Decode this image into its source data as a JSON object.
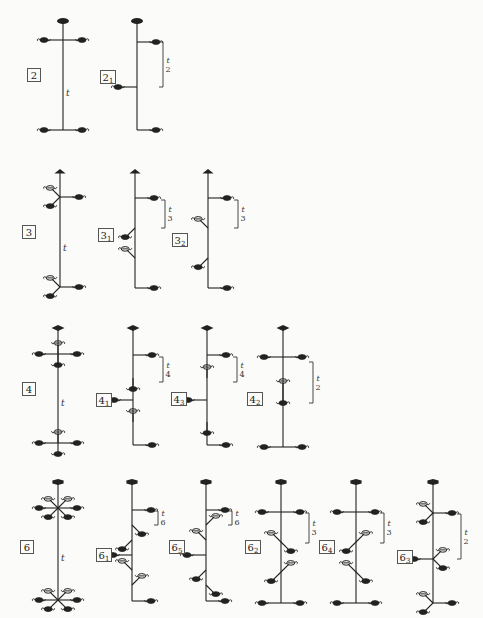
{
  "diagram": {
    "axis_label": "t",
    "rows": [
      {
        "order": 2,
        "elements": [
          {
            "id": "2",
            "label": "2",
            "sub": "",
            "x": 63,
            "top": 21,
            "bottom": 130,
            "box": [
              27,
              68
            ],
            "arms": [
              {
                "y": 40,
                "dirs": [
                  "L",
                  "R"
                ]
              },
              {
                "y": 130,
                "dirs": [
                  "L",
                  "R"
                ]
              }
            ],
            "bracket": null,
            "t_label": [
              66,
              88
            ]
          },
          {
            "id": "2_1",
            "label": "2",
            "sub": "1",
            "x": 137,
            "top": 21,
            "bottom": 130,
            "box": [
              100,
              70
            ],
            "arms": [
              {
                "y": 42,
                "dirs": [
                  "R"
                ]
              },
              {
                "y": 87,
                "dirs": [
                  "L"
                ]
              },
              {
                "y": 130,
                "dirs": [
                  "R"
                ]
              }
            ],
            "bracket": {
              "x": 163,
              "y1": 42,
              "y2": 87,
              "num": "t",
              "den": "2"
            }
          }
        ]
      },
      {
        "order": 3,
        "elements": [
          {
            "id": "3",
            "label": "3",
            "sub": "",
            "x": 60,
            "top": 172,
            "bottom": 287,
            "box": [
              22,
              225
            ],
            "arms": [
              {
                "y": 197,
                "dirs": [
                  "R",
                  "UL",
                  "DL"
                ]
              },
              {
                "y": 287,
                "dirs": [
                  "R",
                  "UL",
                  "DL"
                ]
              }
            ],
            "bracket": null,
            "t_label": [
              63,
              243
            ]
          },
          {
            "id": "3_1",
            "label": "3",
            "sub": "1",
            "x": 135,
            "top": 172,
            "bottom": 288,
            "box": [
              98,
              228
            ],
            "arms": [
              {
                "y": 198,
                "dirs": [
                  "R"
                ]
              },
              {
                "y": 228,
                "dirs": [
                  "DL"
                ]
              },
              {
                "y": 258,
                "dirs": [
                  "UL"
                ]
              },
              {
                "y": 288,
                "dirs": [
                  "R"
                ]
              }
            ],
            "bracket": {
              "x": 165,
              "y1": 200,
              "y2": 228,
              "num": "t",
              "den": "3"
            }
          },
          {
            "id": "3_2",
            "label": "3",
            "sub": "2",
            "x": 208,
            "top": 172,
            "bottom": 288,
            "box": [
              172,
              233
            ],
            "arms": [
              {
                "y": 198,
                "dirs": [
                  "R"
                ]
              },
              {
                "y": 228,
                "dirs": [
                  "UL"
                ]
              },
              {
                "y": 258,
                "dirs": [
                  "DL"
                ]
              },
              {
                "y": 288,
                "dirs": [
                  "R"
                ]
              }
            ],
            "bracket": {
              "x": 238,
              "y1": 200,
              "y2": 228,
              "num": "t",
              "den": "3"
            }
          }
        ]
      },
      {
        "order": 4,
        "elements": [
          {
            "id": "4",
            "label": "4",
            "sub": "",
            "x": 58,
            "top": 328,
            "bottom": 443,
            "box": [
              22,
              382
            ],
            "arms": [
              {
                "y": 354,
                "dirs": [
                  "L",
                  "R",
                  "U",
                  "D"
                ]
              },
              {
                "y": 443,
                "dirs": [
                  "L",
                  "R",
                  "U",
                  "D"
                ]
              }
            ],
            "bracket": null,
            "t_label": [
              61,
              398
            ]
          },
          {
            "id": "4_1",
            "label": "4",
            "sub": "1",
            "x": 133,
            "top": 328,
            "bottom": 445,
            "box": [
              96,
              393
            ],
            "arms": [
              {
                "y": 355,
                "dirs": [
                  "R"
                ]
              },
              {
                "y": 378,
                "dirs": [
                  "D"
                ]
              },
              {
                "y": 400,
                "dirs": [
                  "L"
                ]
              },
              {
                "y": 422,
                "dirs": [
                  "U"
                ]
              },
              {
                "y": 445,
                "dirs": [
                  "R"
                ]
              }
            ],
            "bracket": {
              "x": 163,
              "y1": 357,
              "y2": 382,
              "num": "t",
              "den": "4"
            }
          },
          {
            "id": "4_3",
            "label": "4",
            "sub": "3",
            "x": 207,
            "top": 328,
            "bottom": 445,
            "box": [
              171,
              392
            ],
            "arms": [
              {
                "y": 355,
                "dirs": [
                  "R"
                ]
              },
              {
                "y": 378,
                "dirs": [
                  "U"
                ]
              },
              {
                "y": 400,
                "dirs": [
                  "L"
                ]
              },
              {
                "y": 422,
                "dirs": [
                  "D"
                ]
              },
              {
                "y": 445,
                "dirs": [
                  "R"
                ]
              }
            ],
            "bracket": {
              "x": 237,
              "y1": 357,
              "y2": 382,
              "num": "t",
              "den": "4"
            }
          },
          {
            "id": "4_2",
            "label": "4",
            "sub": "2",
            "x": 283,
            "top": 328,
            "bottom": 447,
            "box": [
              247,
              392
            ],
            "arms": [
              {
                "y": 357,
                "dirs": [
                  "L",
                  "R"
                ]
              },
              {
                "y": 392,
                "dirs": [
                  "U",
                  "D"
                ]
              },
              {
                "y": 447,
                "dirs": [
                  "L",
                  "R"
                ]
              }
            ],
            "bracket": {
              "x": 313,
              "y1": 362,
              "y2": 403,
              "num": "t",
              "den": "2"
            }
          }
        ]
      },
      {
        "order": 6,
        "elements": [
          {
            "id": "6",
            "label": "6",
            "sub": "",
            "x": 58,
            "top": 482,
            "bottom": 600,
            "box": [
              20,
              540
            ],
            "arms": [
              {
                "y": 508,
                "dirs": [
                  "L",
                  "R",
                  "UL",
                  "UR",
                  "DL",
                  "DR"
                ]
              },
              {
                "y": 600,
                "dirs": [
                  "L",
                  "R",
                  "UL",
                  "UR",
                  "DL",
                  "DR"
                ]
              }
            ],
            "bracket": null,
            "t_label": [
              61,
              553
            ]
          },
          {
            "id": "6_1",
            "label": "6",
            "sub": "1",
            "x": 132,
            "top": 482,
            "bottom": 601,
            "box": [
              96,
              548
            ],
            "arms": [
              {
                "y": 510,
                "dirs": [
                  "R"
                ]
              },
              {
                "y": 525,
                "dirs": [
                  "DR"
                ]
              },
              {
                "y": 540,
                "dirs": [
                  "DL"
                ]
              },
              {
                "y": 555,
                "dirs": [
                  "L"
                ]
              },
              {
                "y": 570,
                "dirs": [
                  "UL"
                ]
              },
              {
                "y": 585,
                "dirs": [
                  "UR"
                ]
              },
              {
                "y": 601,
                "dirs": [
                  "R"
                ]
              }
            ],
            "bracket": {
              "x": 158,
              "y1": 511,
              "y2": 525,
              "num": "t",
              "den": "6"
            }
          },
          {
            "id": "6_5",
            "label": "6",
            "sub": "5",
            "x": 206,
            "top": 482,
            "bottom": 601,
            "box": [
              169,
              540
            ],
            "arms": [
              {
                "y": 510,
                "dirs": [
                  "R"
                ]
              },
              {
                "y": 525,
                "dirs": [
                  "UR"
                ]
              },
              {
                "y": 540,
                "dirs": [
                  "UL"
                ]
              },
              {
                "y": 555,
                "dirs": [
                  "L"
                ]
              },
              {
                "y": 570,
                "dirs": [
                  "DL"
                ]
              },
              {
                "y": 585,
                "dirs": [
                  "DR"
                ]
              },
              {
                "y": 601,
                "dirs": [
                  "R"
                ]
              }
            ],
            "bracket": {
              "x": 232,
              "y1": 511,
              "y2": 525,
              "num": "t",
              "den": "6"
            }
          },
          {
            "id": "6_2",
            "label": "6",
            "sub": "2",
            "x": 281,
            "top": 482,
            "bottom": 603,
            "box": [
              245,
              540
            ],
            "arms": [
              {
                "y": 512,
                "dirs": [
                  "L",
                  "R"
                ]
              },
              {
                "y": 542,
                "dirs": [
                  "UL",
                  "DR"
                ]
              },
              {
                "y": 572,
                "dirs": [
                  "UR",
                  "DL"
                ]
              },
              {
                "y": 603,
                "dirs": [
                  "L",
                  "R"
                ]
              }
            ],
            "bracket": {
              "x": 309,
              "y1": 513,
              "y2": 543,
              "num": "t",
              "den": "3"
            }
          },
          {
            "id": "6_4",
            "label": "6",
            "sub": "4",
            "x": 356,
            "top": 482,
            "bottom": 603,
            "box": [
              319,
              540
            ],
            "arms": [
              {
                "y": 512,
                "dirs": [
                  "L",
                  "R"
                ]
              },
              {
                "y": 542,
                "dirs": [
                  "UR",
                  "DL"
                ]
              },
              {
                "y": 572,
                "dirs": [
                  "UL",
                  "DR"
                ]
              },
              {
                "y": 603,
                "dirs": [
                  "L",
                  "R"
                ]
              }
            ],
            "bracket": {
              "x": 384,
              "y1": 513,
              "y2": 543,
              "num": "t",
              "den": "3"
            }
          },
          {
            "id": "6_3",
            "label": "6",
            "sub": "3",
            "x": 433,
            "top": 482,
            "bottom": 603,
            "box": [
              397,
              550
            ],
            "arms": [
              {
                "y": 513,
                "dirs": [
                  "R",
                  "UL",
                  "DL"
                ]
              },
              {
                "y": 559,
                "dirs": [
                  "L",
                  "UR",
                  "DR"
                ]
              },
              {
                "y": 603,
                "dirs": [
                  "R",
                  "UL",
                  "DL"
                ]
              }
            ],
            "bracket": {
              "x": 461,
              "y1": 514,
              "y2": 559,
              "num": "t",
              "den": "2"
            }
          }
        ]
      }
    ]
  },
  "colors": {
    "ink": "#222222",
    "paper": "#fbfbf9",
    "box_border": "#555555"
  }
}
